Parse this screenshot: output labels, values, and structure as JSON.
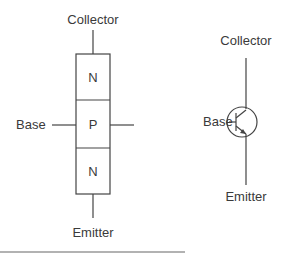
{
  "block_diagram": {
    "labels": {
      "collector": "Collector",
      "base": "Base",
      "emitter": "Emitter"
    },
    "layers": [
      "N",
      "P",
      "N"
    ]
  },
  "symbol_diagram": {
    "labels": {
      "collector": "Collector",
      "base": "Base",
      "emitter": "Emitter"
    },
    "type": "NPN transistor symbol"
  }
}
